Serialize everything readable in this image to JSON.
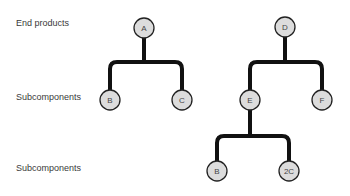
{
  "levels": [
    {
      "label": "End products",
      "y": 24
    },
    {
      "label": "Subcomponents",
      "y": 96
    },
    {
      "label": "Subcomponents",
      "y": 167
    }
  ],
  "colors": {
    "node_fill": "#dcdcdc",
    "node_stroke": "#222222",
    "line": "#111111",
    "text": "#3a3a3a"
  },
  "trees": [
    {
      "root": {
        "id": "A",
        "label": "A",
        "x": 144,
        "y": 28
      },
      "bar_y": 62,
      "children": [
        {
          "id": "B1",
          "label": "B",
          "x": 110,
          "y": 100
        },
        {
          "id": "C1",
          "label": "C",
          "x": 182,
          "y": 100
        }
      ]
    },
    {
      "root": {
        "id": "D",
        "label": "D",
        "x": 285,
        "y": 27
      },
      "bar_y": 62,
      "children": [
        {
          "id": "E",
          "label": "E",
          "x": 250,
          "y": 100
        },
        {
          "id": "F",
          "label": "F",
          "x": 322,
          "y": 100
        }
      ]
    },
    {
      "root": {
        "id": "E",
        "label": "E",
        "x": 250,
        "y": 100
      },
      "bar_y": 136,
      "children": [
        {
          "id": "B2",
          "label": "B",
          "x": 217,
          "y": 171
        },
        {
          "id": "C2",
          "label": "2C",
          "x": 289,
          "y": 171
        }
      ]
    }
  ],
  "nodes": [
    {
      "id": "A",
      "label": "A",
      "x": 144,
      "y": 28
    },
    {
      "id": "B1",
      "label": "B",
      "x": 110,
      "y": 100
    },
    {
      "id": "C1",
      "label": "C",
      "x": 182,
      "y": 100
    },
    {
      "id": "D",
      "label": "D",
      "x": 285,
      "y": 27
    },
    {
      "id": "E",
      "label": "E",
      "x": 250,
      "y": 100
    },
    {
      "id": "F",
      "label": "F",
      "x": 322,
      "y": 100
    },
    {
      "id": "B2",
      "label": "B",
      "x": 217,
      "y": 171
    },
    {
      "id": "C2",
      "label": "2C",
      "x": 289,
      "y": 171
    }
  ]
}
